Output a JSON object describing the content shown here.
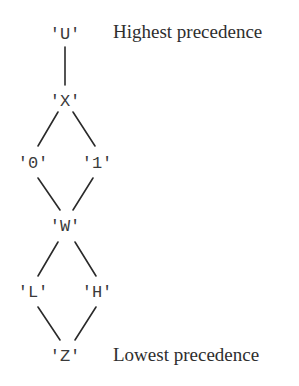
{
  "diagram": {
    "type": "lattice",
    "nodes": [
      {
        "id": "U",
        "label": "'U'",
        "x": 65,
        "y": 39
      },
      {
        "id": "X",
        "label": "'X'",
        "x": 65,
        "y": 106
      },
      {
        "id": "0",
        "label": "'0'",
        "x": 33,
        "y": 168
      },
      {
        "id": "1",
        "label": "'1'",
        "x": 97,
        "y": 168
      },
      {
        "id": "W",
        "label": "'W'",
        "x": 65,
        "y": 231
      },
      {
        "id": "L",
        "label": "'L'",
        "x": 33,
        "y": 297
      },
      {
        "id": "H",
        "label": "'H'",
        "x": 97,
        "y": 297
      },
      {
        "id": "Z",
        "label": "'Z'",
        "x": 65,
        "y": 361
      }
    ],
    "edges": [
      {
        "from": "U",
        "to": "X"
      },
      {
        "from": "X",
        "to": "0"
      },
      {
        "from": "X",
        "to": "1"
      },
      {
        "from": "0",
        "to": "W"
      },
      {
        "from": "1",
        "to": "W"
      },
      {
        "from": "W",
        "to": "L"
      },
      {
        "from": "W",
        "to": "H"
      },
      {
        "from": "L",
        "to": "Z"
      },
      {
        "from": "H",
        "to": "Z"
      }
    ],
    "annotations": {
      "top": "Highest precedence",
      "bottom": "Lowest precedence"
    }
  }
}
